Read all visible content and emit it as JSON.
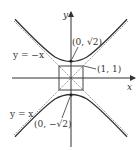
{
  "diagram": {
    "type": "hyperbola-graph",
    "equation_implied": "y^2 - x^2 = 2",
    "axes": {
      "x_label": "x",
      "y_label": "y"
    },
    "asymptotes": [
      {
        "label": "y = −x",
        "slope": -1
      },
      {
        "label": "y = x",
        "slope": 1
      }
    ],
    "points": [
      {
        "label": "(0, √2)",
        "x": 0,
        "y": 1.414
      },
      {
        "label": "(0, −√2)",
        "x": 0,
        "y": -1.414
      },
      {
        "label": "(1, 1)",
        "x": 1,
        "y": 1
      }
    ],
    "box": {
      "x_min": -1,
      "x_max": 1,
      "y_min": -1,
      "y_max": 1
    },
    "colors": {
      "curve": "#333333",
      "asymptote": "#888888",
      "axis": "#333333"
    }
  }
}
